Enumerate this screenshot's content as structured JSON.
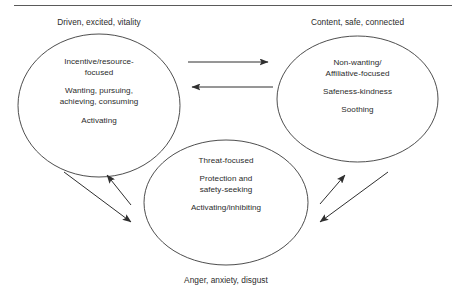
{
  "diagram": {
    "type": "three-circle-affect-regulation-model",
    "top_rule": true,
    "nodes": [
      {
        "id": "drive-system",
        "caption": "Driven, excited, vitality",
        "caption_position": "above",
        "lines": [
          "Incentive/resource-",
          "focused",
          "",
          "Wanting, pursuing,",
          "achieving, consuming",
          "",
          "Activating"
        ]
      },
      {
        "id": "soothing-system",
        "caption": "Content, safe, connected",
        "caption_position": "above",
        "lines": [
          "Non-wanting/",
          "Affiliative-focused",
          "",
          "Safeness-kindness",
          "",
          "Soothing"
        ]
      },
      {
        "id": "threat-system",
        "caption": "Anger, anxiety, disgust",
        "caption_position": "below",
        "lines": [
          "Threat-focused",
          "",
          "Protection and",
          "safety-seeking",
          "",
          "Activating/inhibiting"
        ]
      }
    ],
    "connectors": [
      {
        "id": "drive-to-soothing",
        "from": "drive-system",
        "to": "soothing-system",
        "direction": "right"
      },
      {
        "id": "soothing-to-drive",
        "from": "soothing-system",
        "to": "drive-system",
        "direction": "left"
      },
      {
        "id": "threat-to-drive",
        "from": "threat-system",
        "to": "drive-system",
        "direction": "up-left"
      },
      {
        "id": "drive-to-threat",
        "from": "drive-system",
        "to": "threat-system",
        "direction": "down-right"
      },
      {
        "id": "threat-to-soothing",
        "from": "threat-system",
        "to": "soothing-system",
        "direction": "up-right"
      },
      {
        "id": "soothing-to-threat",
        "from": "soothing-system",
        "to": "threat-system",
        "direction": "down-left"
      }
    ],
    "colors": {
      "background": "#ffffff",
      "outline": "#3a3a3a",
      "text": "#2b2b2b",
      "arrow": "#2f2f2f",
      "rule": "#5a5a5a"
    }
  }
}
